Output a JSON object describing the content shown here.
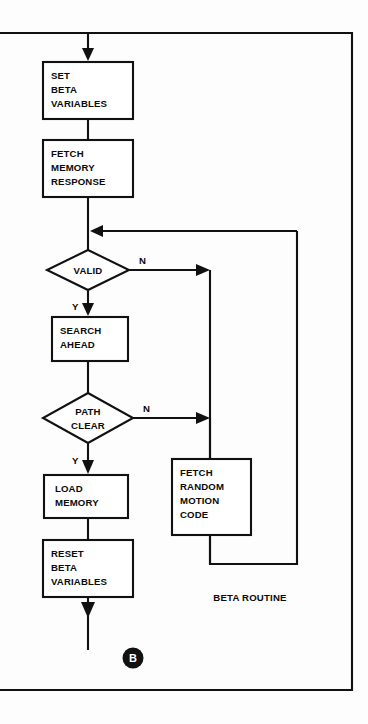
{
  "figure": {
    "name": "beta-routine-flowchart",
    "caption": "BETA ROUTINE",
    "connector_label": "B",
    "background_color": "#fdfdfd",
    "line_color": "#111111",
    "shape_fill": "#ffffff"
  },
  "nodes": {
    "set_beta_variables": {
      "type": "process",
      "lines": [
        "SET",
        "BETA",
        "VARIABLES"
      ]
    },
    "fetch_memory_response": {
      "type": "process",
      "lines": [
        "FETCH",
        "MEMORY",
        "RESPONSE"
      ]
    },
    "valid": {
      "type": "decision",
      "lines": [
        "VALID"
      ]
    },
    "search_ahead": {
      "type": "process",
      "lines": [
        "SEARCH",
        "AHEAD"
      ]
    },
    "path_clear": {
      "type": "decision",
      "lines": [
        "PATH",
        "CLEAR"
      ]
    },
    "load_memory": {
      "type": "process",
      "lines": [
        "LOAD",
        "MEMORY"
      ]
    },
    "reset_beta_variables": {
      "type": "process",
      "lines": [
        "RESET",
        "BETA",
        "VARIABLES"
      ]
    },
    "fetch_random_motion_code": {
      "type": "process",
      "lines": [
        "FETCH",
        "RANDOM",
        "MOTION",
        "CODE"
      ]
    }
  },
  "branch_labels": {
    "valid_no": "N",
    "valid_yes": "Y",
    "path_clear_no": "N",
    "path_clear_yes": "Y"
  },
  "flow": {
    "entry": "top arrow into SET BETA VARIABLES",
    "exit": "bottom arrow out of RESET BETA VARIABLES to connector B",
    "feedback": "FETCH RANDOM MOTION CODE returns to the junction above VALID"
  }
}
